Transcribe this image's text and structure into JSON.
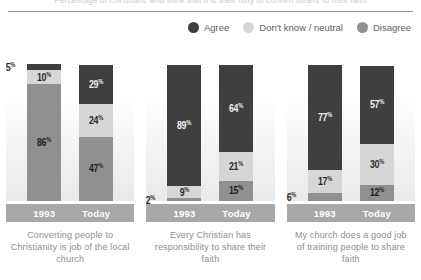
{
  "title_partial": "Percentage of Christians who think that it is their duty to convert others to their faith",
  "legend": {
    "items": [
      {
        "label": "Agree",
        "color": "#3f3f3f",
        "icon": "circle-swatch-icon"
      },
      {
        "label": "Don't know / neutral",
        "color": "#d6d6d6",
        "icon": "circle-swatch-icon"
      },
      {
        "label": "Disagree",
        "color": "#909090",
        "icon": "circle-swatch-icon"
      }
    ]
  },
  "chart_data": {
    "type": "bar",
    "subtype": "stacked-bar-100-partial",
    "title": "Percentage of Christians who think that it is their duty to convert others to their faith",
    "xlabel": "",
    "ylabel": "",
    "ylim": [
      0,
      100
    ],
    "grid": false,
    "legend_position": "top-right",
    "categories": [
      "1993",
      "Today"
    ],
    "series": [
      {
        "name": "Agree",
        "color": "#3f3f3f"
      },
      {
        "name": "Don't know / neutral",
        "color": "#d6d6d6"
      },
      {
        "name": "Disagree",
        "color": "#909090"
      }
    ],
    "groups": [
      {
        "caption": "Converting people to Christianity is job of the local church",
        "bars": [
          {
            "category": "1993",
            "segments": [
              {
                "series": "Agree",
                "value": 5,
                "label": "5",
                "label_placement": "outside-left"
              },
              {
                "series": "Don't know / neutral",
                "value": 10,
                "label": "10",
                "label_placement": "inside"
              },
              {
                "series": "Disagree",
                "value": 86,
                "label": "86",
                "label_placement": "inside"
              }
            ]
          },
          {
            "category": "Today",
            "segments": [
              {
                "series": "Agree",
                "value": 29,
                "label": "29",
                "label_placement": "inside"
              },
              {
                "series": "Don't know / neutral",
                "value": 24,
                "label": "24",
                "label_placement": "inside"
              },
              {
                "series": "Disagree",
                "value": 47,
                "label": "47",
                "label_placement": "inside"
              }
            ]
          }
        ]
      },
      {
        "caption": "Every Christian has responsibility to share their faith",
        "bars": [
          {
            "category": "1993",
            "segments": [
              {
                "series": "Agree",
                "value": 89,
                "label": "89",
                "label_placement": "inside"
              },
              {
                "series": "Don't know / neutral",
                "value": 9,
                "label": "9",
                "label_placement": "inside"
              },
              {
                "series": "Disagree",
                "value": 2,
                "label": "2",
                "label_placement": "outside-left"
              }
            ]
          },
          {
            "category": "Today",
            "segments": [
              {
                "series": "Agree",
                "value": 64,
                "label": "64",
                "label_placement": "inside"
              },
              {
                "series": "Don't know / neutral",
                "value": 21,
                "label": "21",
                "label_placement": "inside"
              },
              {
                "series": "Disagree",
                "value": 15,
                "label": "15",
                "label_placement": "inside"
              }
            ]
          }
        ]
      },
      {
        "caption": "My church does a good job of training people to share faith",
        "bars": [
          {
            "category": "1993",
            "segments": [
              {
                "series": "Agree",
                "value": 77,
                "label": "77",
                "label_placement": "inside"
              },
              {
                "series": "Don't know / neutral",
                "value": 17,
                "label": "17",
                "label_placement": "inside"
              },
              {
                "series": "Disagree",
                "value": 6,
                "label": "6",
                "label_placement": "outside-left"
              }
            ]
          },
          {
            "category": "Today",
            "segments": [
              {
                "series": "Agree",
                "value": 57,
                "label": "57",
                "label_placement": "inside"
              },
              {
                "series": "Don't know / neutral",
                "value": 30,
                "label": "30",
                "label_placement": "inside"
              },
              {
                "series": "Disagree",
                "value": 12,
                "label": "12",
                "label_placement": "inside"
              }
            ]
          }
        ]
      }
    ]
  },
  "percent_symbol": "%"
}
